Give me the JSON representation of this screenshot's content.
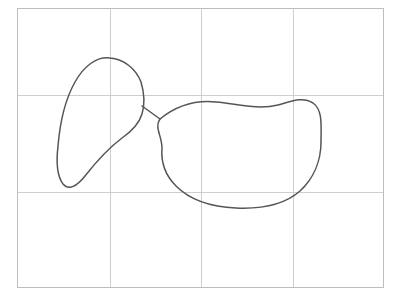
{
  "figure": {
    "title": "Hand-drawn closed curves over faint grid",
    "background_color": "#ffffff",
    "width": 394,
    "height": 295
  },
  "grid": {
    "name": "background-grid",
    "stroke_color": "#c9c9c9",
    "stroke_width": 0.9,
    "border_color": "#bdbdbd",
    "border_width": 1,
    "bounds": {
      "x0": 17,
      "y0": 8,
      "x1": 383,
      "y1": 287
    },
    "vertical_lines": [
      110,
      201,
      293
    ],
    "horizontal_lines": [
      95,
      192
    ],
    "columns": 4,
    "rows": 3
  },
  "shapes": [
    {
      "name": "teardrop-curve",
      "label": "Left teardrop closed curve",
      "stroke_color": "#555555",
      "stroke_width": 1.5,
      "fill": "none",
      "apex_top": [
        110,
        58
      ],
      "leftmost": [
        58,
        172
      ],
      "bottom_tip": [
        64,
        186
      ],
      "neck_join": [
        142,
        106
      ],
      "path": "M 110 58 C 97 56 84 66 75 82 C 66 98 60 122 58 146 C 56 163 57 176 63 184 C 69 191 77 186 85 176 C 96 162 110 147 122 138 C 132 131 139 124 142 114 C 145 104 144 92 141 82 C 136 69 124 59 110 58 Z"
    },
    {
      "name": "bean-curve",
      "label": "Right bean / kidney closed curve",
      "stroke_color": "#555555",
      "stroke_width": 1.5,
      "fill": "none",
      "topmost": [
        296,
        97
      ],
      "rightmost": [
        321,
        143
      ],
      "bottommost": [
        236,
        208
      ],
      "leftmost": [
        162,
        148
      ],
      "neck_join": [
        160,
        119
      ],
      "path": "M 160 119 C 176 106 196 100 216 102 C 238 104 258 110 278 105 C 290 102 302 96 313 103 C 323 110 321 126 321 142 C 321 160 314 178 300 191 C 283 206 258 209 236 208 C 212 207 190 200 176 186 C 164 174 161 160 162 148 C 162 136 154 127 160 119 Z"
    },
    {
      "name": "neck-connector",
      "label": "Narrow neck joining the two curves",
      "stroke_color": "#555555",
      "stroke_width": 1.5,
      "fill": "none",
      "from": [
        142,
        106
      ],
      "to": [
        160,
        119
      ],
      "path": "M 142 106 L 160 119"
    }
  ],
  "annotations": {
    "has_text_labels": false,
    "has_axis_labels": false,
    "has_legend": false
  }
}
